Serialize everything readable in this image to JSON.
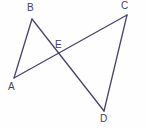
{
  "figure": {
    "kind": "geometry-diagram",
    "background_color": "#fefeff",
    "line_color": "#4a4070",
    "label_color": "#443c62",
    "canvas": {
      "width": 146,
      "height": 128
    },
    "points": {
      "A": {
        "label": "A",
        "x": 14,
        "y": 78,
        "label_x": 8,
        "label_y": 82
      },
      "B": {
        "label": "B",
        "x": 32,
        "y": 19,
        "label_x": 27,
        "label_y": 3
      },
      "C": {
        "label": "C",
        "x": 127,
        "y": 15,
        "label_x": 121,
        "label_y": 1
      },
      "D": {
        "label": "D",
        "x": 104,
        "y": 111,
        "label_x": 100,
        "label_y": 114
      },
      "E": {
        "label": "E",
        "x": 59,
        "y": 54,
        "label_x": 55,
        "label_y": 40
      }
    },
    "segments": [
      {
        "name": "segment-AB",
        "path": "M 14 78 L 32 19"
      },
      {
        "name": "segment-BD",
        "path": "M 32 19 L 104 111"
      },
      {
        "name": "segment-AC",
        "path": "M 14 78 L 127 15"
      },
      {
        "name": "segment-CD",
        "path": "M 127 15 L 104 111"
      }
    ]
  }
}
